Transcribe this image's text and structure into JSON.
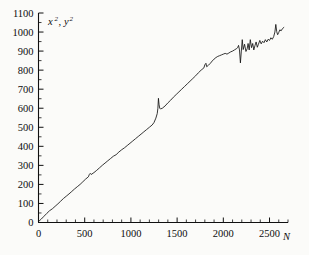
{
  "chart_data": {
    "type": "line",
    "title": "",
    "subtitle": "",
    "xlabel": "N",
    "ylabel": "x², y²",
    "ylabel_parts": [
      {
        "base": "x",
        "sup": "2"
      },
      {
        "base": "y",
        "sup": "2"
      }
    ],
    "ylabel_separator": ",",
    "xlim": [
      0,
      2700
    ],
    "ylim": [
      0,
      1100
    ],
    "grid": false,
    "legend": null,
    "legend_position": "none",
    "x_major_ticks": [
      0,
      500,
      1000,
      1500,
      2000,
      2500
    ],
    "x_major_tick_labels": [
      "0",
      "500",
      "1000",
      "1500",
      "2000",
      "2500"
    ],
    "x_minor_tick_step": 100,
    "y_major_ticks": [
      0,
      100,
      200,
      300,
      400,
      500,
      600,
      700,
      800,
      900,
      1000,
      1100
    ],
    "y_major_tick_labels": [
      "0",
      "100",
      "200",
      "300",
      "400",
      "500",
      "600",
      "700",
      "800",
      "900",
      "1000",
      "1100"
    ],
    "y_minor_tick_step": 50,
    "series": [
      {
        "name": "x², y² vs N",
        "x": [
          0,
          30,
          60,
          90,
          120,
          150,
          180,
          210,
          240,
          270,
          300,
          330,
          360,
          390,
          420,
          450,
          480,
          510,
          540,
          550,
          560,
          570,
          600,
          630,
          660,
          690,
          720,
          750,
          780,
          810,
          840,
          870,
          900,
          930,
          960,
          990,
          1020,
          1050,
          1080,
          1110,
          1140,
          1170,
          1200,
          1230,
          1250,
          1270,
          1285,
          1292,
          1298,
          1305,
          1312,
          1320,
          1340,
          1370,
          1400,
          1430,
          1460,
          1490,
          1520,
          1550,
          1580,
          1610,
          1640,
          1670,
          1700,
          1730,
          1760,
          1790,
          1800,
          1812,
          1820,
          1840,
          1860,
          1880,
          1900,
          1920,
          1940,
          1960,
          1980,
          2000,
          2020,
          2040,
          2060,
          2080,
          2100,
          2120,
          2140,
          2155,
          2165,
          2175,
          2185,
          2195,
          2205,
          2215,
          2230,
          2245,
          2258,
          2268,
          2280,
          2292,
          2305,
          2318,
          2330,
          2342,
          2355,
          2368,
          2380,
          2395,
          2410,
          2425,
          2440,
          2455,
          2470,
          2485,
          2500,
          2515,
          2530,
          2545,
          2558,
          2568,
          2578,
          2588,
          2600,
          2612,
          2625,
          2640,
          2655
        ],
        "y": [
          5,
          18,
          33,
          48,
          62,
          72,
          85,
          98,
          112,
          126,
          138,
          150,
          163,
          176,
          188,
          200,
          214,
          228,
          240,
          252,
          258,
          252,
          262,
          274,
          287,
          300,
          312,
          324,
          336,
          348,
          356,
          370,
          382,
          392,
          404,
          416,
          428,
          440,
          452,
          464,
          476,
          488,
          500,
          512,
          525,
          548,
          572,
          600,
          652,
          618,
          600,
          596,
          600,
          612,
          628,
          642,
          658,
          672,
          686,
          700,
          714,
          728,
          742,
          756,
          770,
          786,
          800,
          812,
          828,
          836,
          818,
          826,
          836,
          848,
          858,
          866,
          872,
          876,
          880,
          884,
          888,
          884,
          890,
          896,
          900,
          906,
          912,
          918,
          930,
          906,
          838,
          900,
          960,
          908,
          936,
          898,
          912,
          940,
          906,
          960,
          918,
          940,
          906,
          928,
          948,
          920,
          936,
          956,
          938,
          952,
          944,
          960,
          948,
          962,
          956,
          970,
          962,
          976,
          1000,
          1040,
          1002,
          986,
          998,
          1012,
          1006,
          1018,
          1024
        ]
      }
    ],
    "annotations": [
      {
        "label": "spike at N≈1300 reaching ≈650",
        "x": 1300,
        "y": 650
      },
      {
        "label": "plateau near N≈1800–1900 at ≈880",
        "x": 1850,
        "y": 880
      },
      {
        "label": "large oscillations beyond N≈2150",
        "x": 2400,
        "y": 950
      }
    ],
    "colors": {
      "curve": "#131313",
      "axis": "#101010",
      "background": "#fbfbf9",
      "text": "#0d0d0d"
    }
  },
  "figure": {
    "caption": ""
  }
}
